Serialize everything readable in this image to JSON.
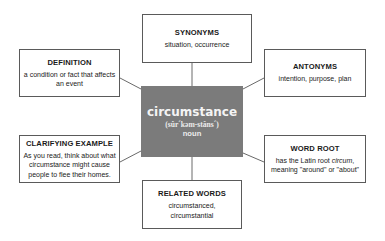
{
  "center": {
    "word": "circumstance",
    "pronunciation": "(sûr´kəm-stăns´)",
    "part_of_speech": "noun",
    "fill_color": "#7b7b7b"
  },
  "boxes": {
    "synonyms": {
      "title": "SYNONYMS",
      "text": "situation, occurrence"
    },
    "definition": {
      "title": "DEFINITION",
      "text": "a condition or fact that affects an event"
    },
    "antonyms": {
      "title": "ANTONYMS",
      "text": "intention, purpose, plan"
    },
    "clarifying_example": {
      "title": "CLARIFYING EXAMPLE",
      "text": "As you read, think about what circumstance might cause people to flee their homes."
    },
    "word_root": {
      "title": "WORD ROOT",
      "text_before": "has the Latin root ",
      "text_italic": "circum",
      "text_after": ", meaning \"around\" or \"about\""
    },
    "related_words": {
      "title": "RELATED WORDS",
      "text": "circumstanced, circumstantial"
    }
  },
  "colors": {
    "border": "#5a5a5a",
    "line": "#6a6a6a"
  }
}
